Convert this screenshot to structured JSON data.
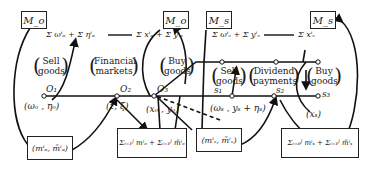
{
  "diagram": {
    "money_boxes": [
      {
        "id": "M_o_left",
        "label": "M_o"
      },
      {
        "id": "M_o_mid",
        "label": "M_o"
      },
      {
        "id": "M_s_mid",
        "label": "M_s"
      },
      {
        "id": "M_s_right",
        "label": "M_s"
      }
    ],
    "bottom_boxes": [
      {
        "id": "mo_pair",
        "label": "(mⁱₒ, m̃ⁱₒ)"
      },
      {
        "id": "mo_sum",
        "label": "Σᵢ₌₁ᴶ mⁱₒ + Σᵢ₌₁ᴶ m̃ⁱₒ"
      },
      {
        "id": "ms_pair",
        "label": "(mⁱₛ, m̃ⁱₛ)"
      },
      {
        "id": "ms_sum",
        "label": "Σᵢ₌₀ᴶ mⁱₛ + Σᵢ₌₁ᴶ m̃ⁱₛ"
      }
    ],
    "top_expressions": {
      "left": "Σ ωⁱₒ + Σ ηⁱₒ",
      "middle": "Σ xⁱₒ + Σ yⁱₒ",
      "right_a": "Σ ωⁱₛ + Σ yⁱₛ",
      "right_b": "Σ xⁱₛ"
    },
    "markets": [
      {
        "line1": "Sell",
        "line2": "goods"
      },
      {
        "line1": "Financial",
        "line2": "markets"
      },
      {
        "line1": "Buy",
        "line2": "goods"
      },
      {
        "line1": "Sell",
        "line2": "goods"
      },
      {
        "line1": "Dividend",
        "line2": "payments"
      },
      {
        "line1": "Buy",
        "line2": "goods"
      }
    ],
    "nodes": {
      "O1": "O₁",
      "O2": "O₂",
      "O3": "O₃",
      "s1": "s₁",
      "s2": "s₂",
      "s3": "s₃"
    },
    "node_labels": {
      "omega_eta_o": "(ωₒ , ηₒ)",
      "z_xi": "(z, ξ)",
      "x_y_o": "(xₒ , yₒ)",
      "omega_y_eta_s": "(ωₛ , yₛ + ηₛ)",
      "x_s": "(xₛ)"
    },
    "sum_index": {
      "upper": "J",
      "lower": "i = 1"
    }
  }
}
